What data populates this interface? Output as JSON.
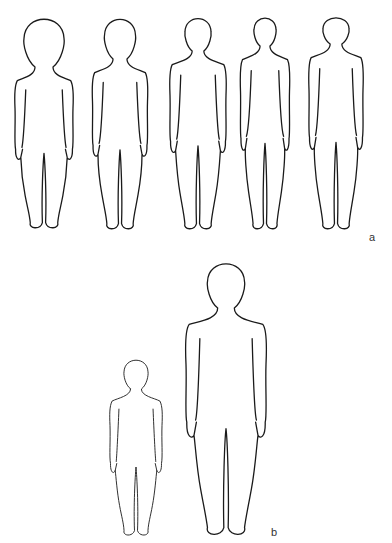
{
  "panels": [
    {
      "label": "a",
      "label_pos": {
        "x": 369,
        "y": 232
      },
      "description": "Five child body outlines of increasing slenderness, same height",
      "figures": [
        {
          "cx": 44,
          "top": 14,
          "bottom": 229,
          "head_w": 40,
          "head_h": 54,
          "shoulder_w": 58,
          "hip_w": 46,
          "stroke": 1.3
        },
        {
          "cx": 120,
          "top": 15,
          "bottom": 230,
          "head_w": 31,
          "head_h": 45,
          "shoulder_w": 55,
          "hip_w": 44,
          "stroke": 1.3
        },
        {
          "cx": 198,
          "top": 15,
          "bottom": 230,
          "head_w": 26,
          "head_h": 37,
          "shoulder_w": 56,
          "hip_w": 44,
          "stroke": 1.3
        },
        {
          "cx": 265,
          "top": 15,
          "bottom": 230,
          "head_w": 22,
          "head_h": 32,
          "shoulder_w": 49,
          "hip_w": 40,
          "stroke": 1.3
        },
        {
          "cx": 336,
          "top": 15,
          "bottom": 230,
          "head_w": 26,
          "head_h": 30,
          "shoulder_w": 54,
          "hip_w": 44,
          "stroke": 1.3
        }
      ]
    },
    {
      "label": "b",
      "label_pos": {
        "x": 271,
        "y": 527
      },
      "description": "Small child outline next to large child outline",
      "figures": [
        {
          "cx": 136,
          "top": 357,
          "bottom": 536,
          "head_w": 24,
          "head_h": 33,
          "shoulder_w": 52,
          "hip_w": 40,
          "stroke": 0.9
        },
        {
          "cx": 226,
          "top": 259,
          "bottom": 536,
          "head_w": 37,
          "head_h": 50,
          "shoulder_w": 80,
          "hip_w": 62,
          "stroke": 1.3
        }
      ]
    }
  ],
  "colors": {
    "stroke": "#1a1a1a",
    "background": "#ffffff",
    "label": "#333333"
  }
}
